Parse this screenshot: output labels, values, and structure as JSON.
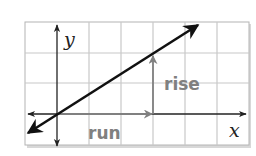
{
  "diagram": {
    "axes": {
      "x_label": "x",
      "y_label": "y"
    },
    "annotations": {
      "rise_label": "rise",
      "run_label": "run"
    },
    "grid": {
      "columns": 7,
      "rows": 4,
      "origin_column": 1,
      "origin_row": 3
    },
    "line": {
      "passes_through": [
        "origin",
        "(3, 2)"
      ],
      "run": 3,
      "rise": 2
    },
    "colors": {
      "grid": "#c8c8c8",
      "grid_border": "#b0b0b0",
      "axis": "#222222",
      "line": "#111111",
      "annotation": "#808080",
      "shadow": "#d4d4d4"
    }
  }
}
